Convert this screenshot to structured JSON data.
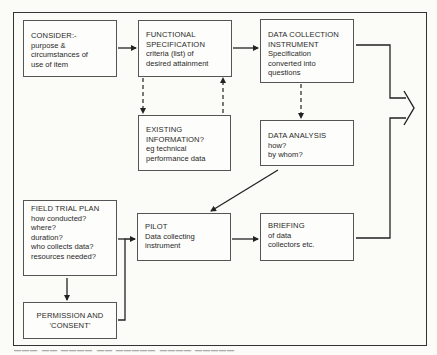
{
  "diagram": {
    "boxes": {
      "consider": {
        "title": "CONSIDER:-",
        "lines": [
          "purpose &",
          "circumstances of",
          "use of item"
        ]
      },
      "functional_specification": {
        "title_lines": [
          "FUNCTIONAL",
          "SPECIFICATION"
        ],
        "lines": [
          "criteria (list) of",
          "desired attainment"
        ]
      },
      "data_collection_instrument": {
        "title_lines": [
          "DATA COLLECTION",
          "INSTRUMENT"
        ],
        "lines": [
          "Specification",
          "converted into",
          "questions"
        ]
      },
      "existing_information": {
        "title_lines": [
          "EXISTING",
          "INFORMATION?"
        ],
        "lines": [
          "eg technical",
          "performance data"
        ]
      },
      "data_analysis": {
        "title": "DATA ANALYSIS",
        "lines": [
          "how?",
          "by whom?"
        ]
      },
      "field_trial_plan": {
        "title": "FIELD TRIAL PLAN",
        "lines": [
          "how conducted?",
          "where?",
          "duration?",
          "who collects data?",
          "resources needed?"
        ]
      },
      "pilot": {
        "title": "PILOT",
        "lines": [
          "Data collecting",
          "instrument"
        ]
      },
      "briefing": {
        "title": "BRIEFING",
        "lines": [
          "of data",
          "collectors etc."
        ]
      },
      "permission": {
        "title_lines": [
          "PERMISSION AND",
          "'CONSENT'"
        ]
      }
    },
    "connections": [
      {
        "from": "consider",
        "to": "functional_specification",
        "style": "solid"
      },
      {
        "from": "functional_specification",
        "to": "data_collection_instrument",
        "style": "solid"
      },
      {
        "from": "functional_specification",
        "to": "existing_information",
        "style": "dashed"
      },
      {
        "from": "existing_information",
        "to": "functional_specification",
        "style": "dashed"
      },
      {
        "from": "data_collection_instrument",
        "to": "data_analysis",
        "style": "dashed"
      },
      {
        "from": "data_analysis",
        "to": "pilot",
        "style": "solid"
      },
      {
        "from": "field_trial_plan",
        "to": "permission",
        "style": "solid"
      },
      {
        "from": "permission",
        "to": "pilot",
        "style": "solid"
      },
      {
        "from": "pilot",
        "to": "briefing",
        "style": "solid"
      },
      {
        "from": "data_collection_instrument",
        "to": "merge-output",
        "style": "solid"
      },
      {
        "from": "briefing",
        "to": "merge-output",
        "style": "solid"
      }
    ],
    "colors": {
      "line": "#222222",
      "box_border": "#555555",
      "background": "#fbfbf8",
      "text": "#2a2a2a"
    }
  }
}
